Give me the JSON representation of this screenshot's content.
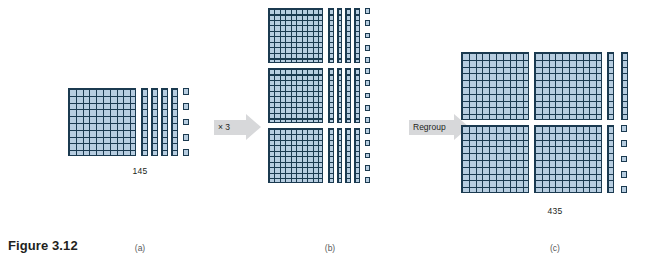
{
  "figure": {
    "title": "Figure 3.12",
    "topic": "base-ten blocks multiplication with regrouping"
  },
  "panels": [
    {
      "id": "a",
      "label": "(a)",
      "value_label": "145",
      "flats": 1,
      "rods": 4,
      "units": 5
    },
    {
      "id": "b",
      "label": "(b)",
      "value_label": "",
      "groups": 3,
      "flats_per_group": 1,
      "rods_per_group": 4,
      "units_per_group": 5
    },
    {
      "id": "c",
      "label": "(c)",
      "value_label": "435",
      "flats": 4,
      "rods": 3,
      "units": 5
    }
  ],
  "arrows": [
    {
      "id": "multiply",
      "label": "× 3"
    },
    {
      "id": "regroup",
      "label": "Regroup"
    }
  ],
  "colors": {
    "block_fill": "#b7cde0",
    "block_line": "#1b3a50",
    "arrow_fill": "#d7d8da",
    "text": "#231f20",
    "label_text": "#58595b",
    "background": "#ffffff"
  }
}
